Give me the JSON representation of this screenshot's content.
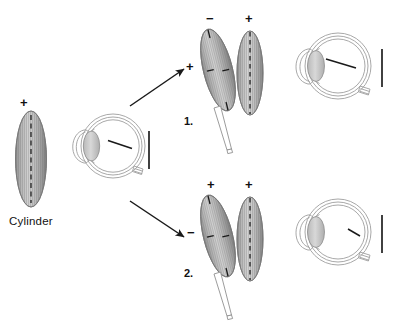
{
  "figure": {
    "type": "optics-diagram",
    "background_color": "#ffffff",
    "ink_color": "#1a1a1a",
    "lens_fill_light": "#e8e8e8",
    "lens_fill_mid": "#a9a9a9",
    "lens_fill_dark": "#6e6e6e",
    "eye_outline_color": "#9a9a9a"
  },
  "source_panel": {
    "name": "cylinder-source",
    "caption": "Cylinder",
    "plus_sign": "+",
    "lens": {
      "axis_style": "dashed-vertical",
      "orientation_deg": 0,
      "striations": "vertical"
    },
    "eye": {
      "focal_line": "oblique",
      "retina_bar": "|"
    }
  },
  "arrows": [
    {
      "name": "arrow-to-panel-1",
      "direction": "up-right",
      "glyph": "↗"
    },
    {
      "name": "arrow-to-panel-2",
      "direction": "down-right",
      "glyph": "↘"
    }
  ],
  "panels": [
    {
      "number": "1.",
      "name": "panel-one",
      "tilted_lens": {
        "top_sign": "−",
        "side_sign": "+",
        "tilt_deg": -14,
        "has_handle": true
      },
      "upright_lens": {
        "top_sign": "+",
        "axis_style": "dashed-vertical"
      },
      "eye": {
        "focal_line": "oblique-long",
        "retina_bar": "|"
      }
    },
    {
      "number": "2.",
      "name": "panel-two",
      "tilted_lens": {
        "top_sign": "+",
        "side_sign": "−",
        "tilt_deg": -14,
        "has_handle": true
      },
      "upright_lens": {
        "top_sign": "+",
        "axis_style": "dashed-vertical"
      },
      "eye": {
        "focal_line": "oblique-short",
        "retina_bar": "|"
      }
    }
  ]
}
